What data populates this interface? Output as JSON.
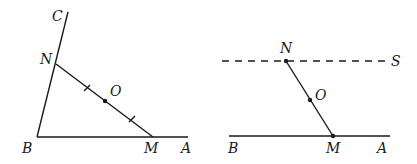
{
  "figures": [
    {
      "id": "left",
      "description": "Angle ABC with segment NM through midpoint O",
      "labels": {
        "C": "C",
        "N": "N",
        "O": "O",
        "B": "B",
        "M": "M",
        "A": "A"
      },
      "points": {
        "B": [
          37,
          137
        ],
        "C_end": [
          68,
          12
        ],
        "N": [
          56,
          64
        ],
        "O": [
          105,
          101
        ],
        "M": [
          153,
          137
        ],
        "A_end": [
          188,
          137
        ]
      },
      "tick_marks": [
        [
          87,
          88
        ],
        [
          132,
          119
        ]
      ]
    },
    {
      "id": "right",
      "description": "Line BA with dashed line S parallel, segment NM through O",
      "labels": {
        "N": "N",
        "S": "S",
        "O": "O",
        "B": "B",
        "M": "M",
        "A": "A"
      },
      "points": {
        "dash_start": [
          222,
          61
        ],
        "dash_end": [
          386,
          61
        ],
        "N": [
          286,
          61
        ],
        "O": [
          310,
          100
        ],
        "M": [
          333,
          136
        ],
        "line_start": [
          229,
          136
        ],
        "line_end": [
          390,
          136
        ]
      }
    }
  ]
}
